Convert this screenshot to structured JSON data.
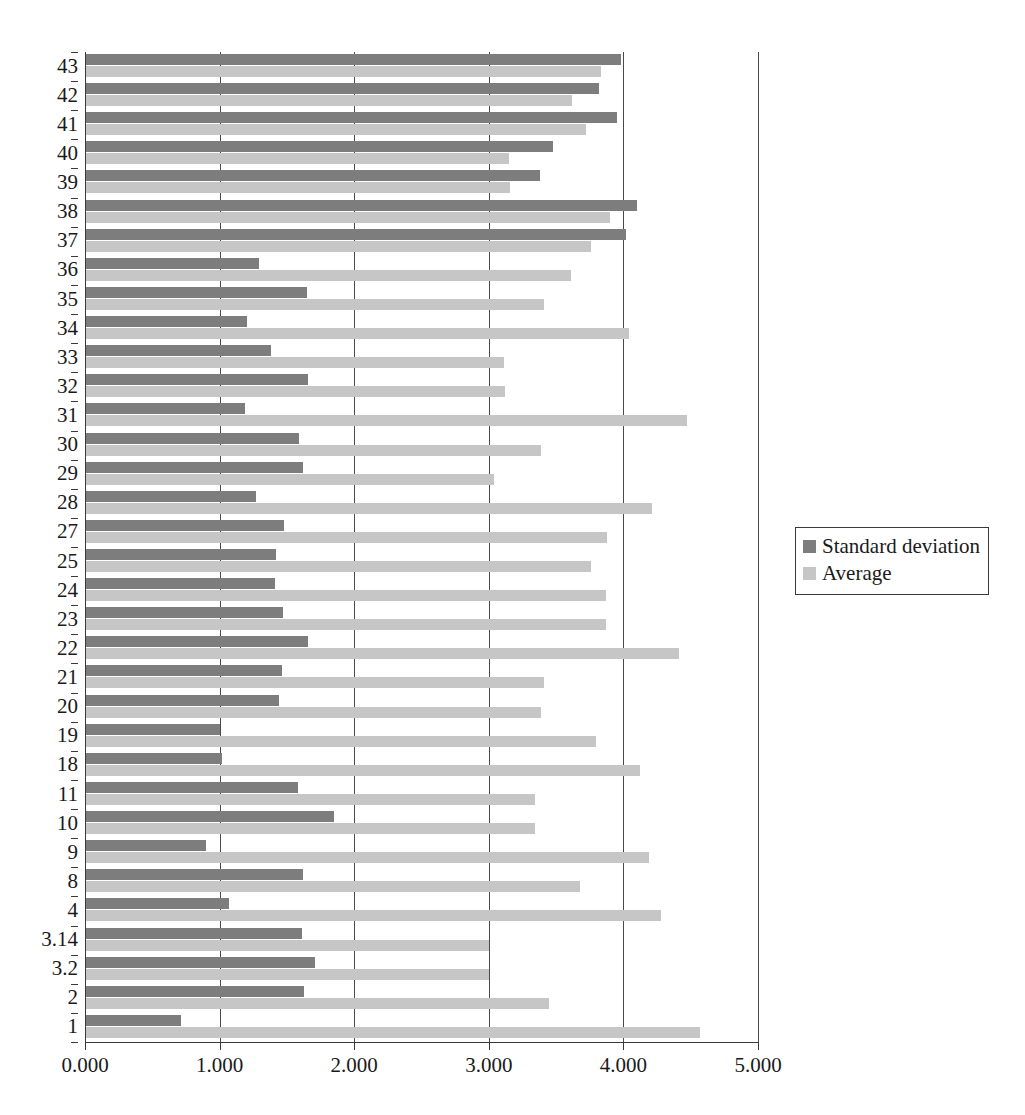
{
  "chart_data": {
    "type": "bar",
    "orientation": "horizontal",
    "title": "",
    "xlabel": "",
    "ylabel": "",
    "xlim": [
      0,
      5
    ],
    "xticks": [
      "0.000",
      "1.000",
      "2.000",
      "3.000",
      "4.000",
      "5.000"
    ],
    "xtick_values": [
      0,
      1,
      2,
      3,
      4,
      5
    ],
    "grid": true,
    "grid_axis": "x",
    "legend": {
      "position": "right",
      "entries": [
        {
          "name": "Standard deviation",
          "color": "#7d7d7d"
        },
        {
          "name": "Average",
          "color": "#c6c6c6"
        }
      ]
    },
    "categories": [
      "43",
      "42",
      "41",
      "40",
      "39",
      "38",
      "37",
      "36",
      "35",
      "34",
      "33",
      "32",
      "31",
      "30",
      "29",
      "28",
      "27",
      "25",
      "24",
      "23",
      "22",
      "21",
      "20",
      "19",
      "18",
      "11",
      "10",
      "9",
      "8",
      "4",
      "3.14",
      "3.2",
      "2",
      "1"
    ],
    "series": [
      {
        "name": "Standard deviation",
        "color": "#7d7d7d",
        "values": [
          3.98,
          3.82,
          3.95,
          3.48,
          3.38,
          4.1,
          4.02,
          1.29,
          1.65,
          1.2,
          1.38,
          1.66,
          1.19,
          1.59,
          1.62,
          1.27,
          1.48,
          1.42,
          1.41,
          1.47,
          1.66,
          1.46,
          1.44,
          1.0,
          1.02,
          1.58,
          1.85,
          0.9,
          1.62,
          1.07,
          1.61,
          1.71,
          1.63,
          0.71
        ]
      },
      {
        "name": "Average",
        "color": "#c6c6c6",
        "values": [
          3.83,
          3.62,
          3.72,
          3.15,
          3.16,
          3.9,
          3.76,
          3.61,
          3.41,
          4.04,
          3.11,
          3.12,
          4.47,
          3.39,
          3.04,
          4.21,
          3.88,
          3.76,
          3.87,
          3.87,
          4.41,
          3.41,
          3.39,
          3.8,
          4.12,
          3.34,
          3.34,
          4.19,
          3.68,
          4.28,
          3.0,
          3.0,
          3.45,
          4.57
        ]
      }
    ]
  }
}
